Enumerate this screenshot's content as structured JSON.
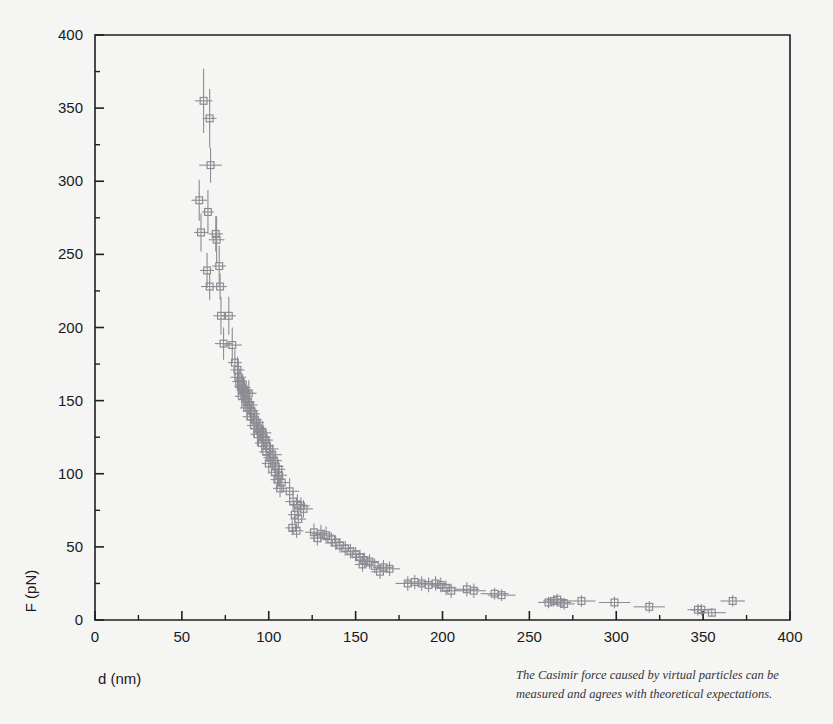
{
  "figure": {
    "background_color": "#f5f5f3",
    "frame_color": "#1f1f1f",
    "data_color": "#8c8c94"
  },
  "caption": {
    "line1": "The Casimir force caused by virtual particles can be",
    "line2": "measured and agrees with theoretical expectations."
  },
  "chart_data": {
    "type": "scatter",
    "title": "",
    "subtitle": "",
    "xlabel": "d (nm)",
    "ylabel": "F (pN)",
    "xlim": [
      0,
      400
    ],
    "ylim": [
      0,
      400
    ],
    "x_major_ticks": [
      0,
      50,
      100,
      150,
      200,
      250,
      300,
      350,
      400
    ],
    "x_minor_ticks": [
      25,
      75,
      125,
      175,
      225,
      275,
      325,
      375
    ],
    "y_major_ticks": [
      0,
      50,
      100,
      150,
      200,
      250,
      300,
      350,
      400
    ],
    "y_minor_ticks": [
      25,
      75,
      125,
      175,
      225,
      275,
      325,
      375
    ],
    "x_tick_labels": [
      "0",
      "50",
      "100",
      "150",
      "200",
      "250",
      "300",
      "350",
      "400"
    ],
    "y_tick_labels": [
      "0",
      "50",
      "100",
      "150",
      "200",
      "250",
      "300",
      "350",
      "400"
    ],
    "grid": false,
    "legend": null,
    "marker_style": "open-square",
    "error_bars": "both",
    "series": [
      {
        "name": "Casimir force measurement",
        "points": [
          {
            "x": 62.5,
            "y": 355,
            "xerr": 5.0,
            "yerr": 22
          },
          {
            "x": 66.0,
            "y": 343,
            "xerr": 4.0,
            "yerr": 20
          },
          {
            "x": 66.5,
            "y": 311,
            "xerr": 6.5,
            "yerr": 12
          },
          {
            "x": 60.0,
            "y": 287,
            "xerr": 4.5,
            "yerr": 14
          },
          {
            "x": 65.0,
            "y": 279,
            "xerr": 3.5,
            "yerr": 15
          },
          {
            "x": 61.0,
            "y": 265,
            "xerr": 4.0,
            "yerr": 13
          },
          {
            "x": 69.5,
            "y": 264,
            "xerr": 4.0,
            "yerr": 12
          },
          {
            "x": 70.0,
            "y": 260,
            "xerr": 4.5,
            "yerr": 16
          },
          {
            "x": 71.5,
            "y": 242,
            "xerr": 4.0,
            "yerr": 14
          },
          {
            "x": 64.5,
            "y": 239,
            "xerr": 4.0,
            "yerr": 12
          },
          {
            "x": 66.0,
            "y": 228,
            "xerr": 5.0,
            "yerr": 9
          },
          {
            "x": 72.0,
            "y": 228,
            "xerr": 4.0,
            "yerr": 9
          },
          {
            "x": 72.5,
            "y": 208,
            "xerr": 4.5,
            "yerr": 13
          },
          {
            "x": 77.0,
            "y": 208,
            "xerr": 4.0,
            "yerr": 13
          },
          {
            "x": 74.0,
            "y": 189,
            "xerr": 5.0,
            "yerr": 11
          },
          {
            "x": 79.0,
            "y": 188,
            "xerr": 5.5,
            "yerr": 12
          },
          {
            "x": 80.5,
            "y": 176,
            "xerr": 4.0,
            "yerr": 9
          },
          {
            "x": 82.0,
            "y": 171,
            "xerr": 4.0,
            "yerr": 9
          },
          {
            "x": 82.5,
            "y": 166,
            "xerr": 4.5,
            "yerr": 9
          },
          {
            "x": 83.0,
            "y": 163,
            "xerr": 4.0,
            "yerr": 9
          },
          {
            "x": 84.0,
            "y": 160,
            "xerr": 4.0,
            "yerr": 9
          },
          {
            "x": 85.0,
            "y": 159,
            "xerr": 4.5,
            "yerr": 9
          },
          {
            "x": 85.5,
            "y": 157,
            "xerr": 4.0,
            "yerr": 9
          },
          {
            "x": 86.0,
            "y": 156,
            "xerr": 4.0,
            "yerr": 9
          },
          {
            "x": 87.0,
            "y": 155,
            "xerr": 5.0,
            "yerr": 9
          },
          {
            "x": 88.5,
            "y": 155,
            "xerr": 4.5,
            "yerr": 9
          },
          {
            "x": 84.5,
            "y": 153,
            "xerr": 4.0,
            "yerr": 8
          },
          {
            "x": 86.5,
            "y": 151,
            "xerr": 4.0,
            "yerr": 8
          },
          {
            "x": 88.0,
            "y": 149,
            "xerr": 4.0,
            "yerr": 8
          },
          {
            "x": 89.0,
            "y": 147,
            "xerr": 4.5,
            "yerr": 8
          },
          {
            "x": 87.5,
            "y": 145,
            "xerr": 4.0,
            "yerr": 8
          },
          {
            "x": 90.0,
            "y": 143,
            "xerr": 4.0,
            "yerr": 8
          },
          {
            "x": 91.0,
            "y": 141,
            "xerr": 4.0,
            "yerr": 8
          },
          {
            "x": 89.5,
            "y": 139,
            "xerr": 4.5,
            "yerr": 8
          },
          {
            "x": 92.0,
            "y": 137,
            "xerr": 4.0,
            "yerr": 8
          },
          {
            "x": 93.0,
            "y": 135,
            "xerr": 4.0,
            "yerr": 8
          },
          {
            "x": 91.5,
            "y": 133,
            "xerr": 4.0,
            "yerr": 8
          },
          {
            "x": 94.0,
            "y": 131,
            "xerr": 4.5,
            "yerr": 8
          },
          {
            "x": 95.0,
            "y": 129,
            "xerr": 4.0,
            "yerr": 8
          },
          {
            "x": 96.5,
            "y": 128,
            "xerr": 5.0,
            "yerr": 8
          },
          {
            "x": 93.5,
            "y": 127,
            "xerr": 4.0,
            "yerr": 8
          },
          {
            "x": 97.0,
            "y": 125,
            "xerr": 4.0,
            "yerr": 8
          },
          {
            "x": 98.0,
            "y": 123,
            "xerr": 4.5,
            "yerr": 7
          },
          {
            "x": 96.0,
            "y": 121,
            "xerr": 4.0,
            "yerr": 7
          },
          {
            "x": 99.0,
            "y": 119,
            "xerr": 4.0,
            "yerr": 7
          },
          {
            "x": 100.5,
            "y": 117,
            "xerr": 5.0,
            "yerr": 7
          },
          {
            "x": 98.5,
            "y": 115,
            "xerr": 4.0,
            "yerr": 7
          },
          {
            "x": 102.0,
            "y": 113,
            "xerr": 5.5,
            "yerr": 7
          },
          {
            "x": 101.0,
            "y": 111,
            "xerr": 4.0,
            "yerr": 7
          },
          {
            "x": 103.0,
            "y": 109,
            "xerr": 4.5,
            "yerr": 7
          },
          {
            "x": 100.0,
            "y": 107,
            "xerr": 4.0,
            "yerr": 7
          },
          {
            "x": 104.0,
            "y": 105,
            "xerr": 4.5,
            "yerr": 7
          },
          {
            "x": 105.5,
            "y": 103,
            "xerr": 4.0,
            "yerr": 7
          },
          {
            "x": 103.5,
            "y": 101,
            "xerr": 4.0,
            "yerr": 7
          },
          {
            "x": 106.0,
            "y": 99,
            "xerr": 4.5,
            "yerr": 7
          },
          {
            "x": 105.0,
            "y": 96,
            "xerr": 4.0,
            "yerr": 7
          },
          {
            "x": 107.5,
            "y": 94,
            "xerr": 4.5,
            "yerr": 7
          },
          {
            "x": 106.5,
            "y": 90,
            "xerr": 4.0,
            "yerr": 6
          },
          {
            "x": 112.0,
            "y": 88,
            "xerr": 5.5,
            "yerr": 9
          },
          {
            "x": 114.0,
            "y": 81,
            "xerr": 4.5,
            "yerr": 7
          },
          {
            "x": 116.5,
            "y": 79,
            "xerr": 4.5,
            "yerr": 7
          },
          {
            "x": 118.5,
            "y": 78,
            "xerr": 5.0,
            "yerr": 6
          },
          {
            "x": 120.0,
            "y": 76,
            "xerr": 5.5,
            "yerr": 6
          },
          {
            "x": 115.0,
            "y": 72,
            "xerr": 4.0,
            "yerr": 6
          },
          {
            "x": 117.0,
            "y": 69,
            "xerr": 4.5,
            "yerr": 6
          },
          {
            "x": 113.5,
            "y": 63,
            "xerr": 4.0,
            "yerr": 5
          },
          {
            "x": 116.0,
            "y": 61,
            "xerr": 4.0,
            "yerr": 5
          },
          {
            "x": 126.0,
            "y": 60,
            "xerr": 5.0,
            "yerr": 6
          },
          {
            "x": 130.0,
            "y": 59,
            "xerr": 5.5,
            "yerr": 6
          },
          {
            "x": 133.0,
            "y": 58,
            "xerr": 5.0,
            "yerr": 6
          },
          {
            "x": 128.0,
            "y": 56,
            "xerr": 4.5,
            "yerr": 5
          },
          {
            "x": 136.0,
            "y": 55,
            "xerr": 5.0,
            "yerr": 5
          },
          {
            "x": 138.5,
            "y": 53,
            "xerr": 5.0,
            "yerr": 5
          },
          {
            "x": 141.0,
            "y": 51,
            "xerr": 5.0,
            "yerr": 5
          },
          {
            "x": 144.0,
            "y": 49,
            "xerr": 5.0,
            "yerr": 5
          },
          {
            "x": 147.0,
            "y": 47,
            "xerr": 5.0,
            "yerr": 5
          },
          {
            "x": 150.0,
            "y": 45,
            "xerr": 5.5,
            "yerr": 5
          },
          {
            "x": 152.5,
            "y": 43,
            "xerr": 5.0,
            "yerr": 5
          },
          {
            "x": 155.0,
            "y": 41,
            "xerr": 5.0,
            "yerr": 5
          },
          {
            "x": 158.0,
            "y": 40,
            "xerr": 5.5,
            "yerr": 5
          },
          {
            "x": 154.0,
            "y": 38,
            "xerr": 4.5,
            "yerr": 5
          },
          {
            "x": 161.0,
            "y": 37,
            "xerr": 5.5,
            "yerr": 5
          },
          {
            "x": 166.0,
            "y": 36,
            "xerr": 6.0,
            "yerr": 5
          },
          {
            "x": 169.5,
            "y": 35,
            "xerr": 6.0,
            "yerr": 5
          },
          {
            "x": 164.0,
            "y": 33,
            "xerr": 5.0,
            "yerr": 5
          },
          {
            "x": 180.0,
            "y": 25,
            "xerr": 7.0,
            "yerr": 5
          },
          {
            "x": 184.0,
            "y": 26,
            "xerr": 6.0,
            "yerr": 5
          },
          {
            "x": 188.0,
            "y": 25,
            "xerr": 6.0,
            "yerr": 5
          },
          {
            "x": 192.0,
            "y": 24,
            "xerr": 6.0,
            "yerr": 5
          },
          {
            "x": 196.0,
            "y": 25,
            "xerr": 6.0,
            "yerr": 5
          },
          {
            "x": 199.0,
            "y": 24,
            "xerr": 6.0,
            "yerr": 5
          },
          {
            "x": 202.0,
            "y": 22,
            "xerr": 6.0,
            "yerr": 5
          },
          {
            "x": 205.0,
            "y": 20,
            "xerr": 6.0,
            "yerr": 5
          },
          {
            "x": 214.0,
            "y": 21,
            "xerr": 7.0,
            "yerr": 5
          },
          {
            "x": 218.0,
            "y": 20,
            "xerr": 7.0,
            "yerr": 5
          },
          {
            "x": 230.0,
            "y": 18,
            "xerr": 8.0,
            "yerr": 4
          },
          {
            "x": 234.0,
            "y": 17,
            "xerr": 8.0,
            "yerr": 4
          },
          {
            "x": 261.0,
            "y": 12,
            "xerr": 6.0,
            "yerr": 4
          },
          {
            "x": 264.0,
            "y": 13,
            "xerr": 6.0,
            "yerr": 4
          },
          {
            "x": 266.0,
            "y": 14,
            "xerr": 6.0,
            "yerr": 4
          },
          {
            "x": 268.0,
            "y": 12,
            "xerr": 6.0,
            "yerr": 4
          },
          {
            "x": 270.0,
            "y": 11,
            "xerr": 6.0,
            "yerr": 4
          },
          {
            "x": 280.0,
            "y": 13,
            "xerr": 8.0,
            "yerr": 4
          },
          {
            "x": 299.0,
            "y": 12,
            "xerr": 9.0,
            "yerr": 4
          },
          {
            "x": 319.0,
            "y": 9,
            "xerr": 9.0,
            "yerr": 4
          },
          {
            "x": 347.0,
            "y": 7,
            "xerr": 6.0,
            "yerr": 4
          },
          {
            "x": 349.0,
            "y": 7,
            "xerr": 6.0,
            "yerr": 4
          },
          {
            "x": 355.0,
            "y": 5,
            "xerr": 8.0,
            "yerr": 3
          },
          {
            "x": 367.0,
            "y": 13,
            "xerr": 7.0,
            "yerr": 4
          }
        ]
      }
    ]
  }
}
